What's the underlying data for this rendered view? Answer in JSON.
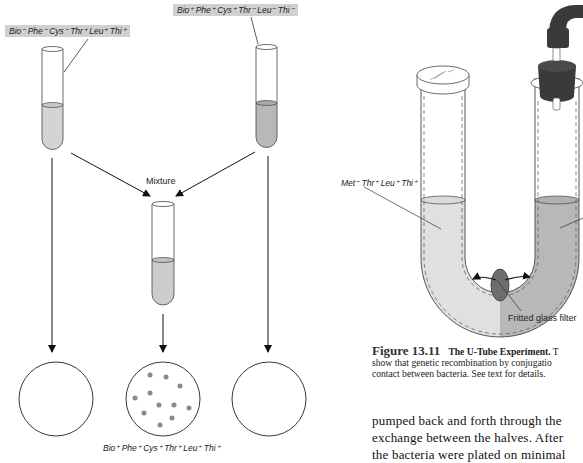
{
  "left_figure": {
    "strain_a_label": "Bio⁻ Phe⁻ Cys⁻ Thr⁺ Leu⁺ Thi⁺",
    "strain_b_label": "Bio⁺ Phe⁺ Cys⁺ Thr⁻ Leu⁻ Thi⁻",
    "mixture_label": "Mixture",
    "result_label": "Bio⁺ Phe⁺ Cys⁺ Thr⁺ Leu⁺ Thi⁺",
    "plates": [
      {
        "name": "strain-a-plate",
        "colonies": 0
      },
      {
        "name": "mixture-plate",
        "colonies": 12
      },
      {
        "name": "strain-b-plate",
        "colonies": 0
      }
    ]
  },
  "right_figure": {
    "left_arm_label": "Met⁻ Thr⁺ Leu⁺ Thi⁺",
    "filter_label": "Fritted glass filter",
    "caption": {
      "figure_number": "Figure 13.11",
      "title": "The U-Tube Experiment.",
      "line1_rest": " T",
      "line2": "show that genetic recombination by conjugatio",
      "line3": "contact between bacteria. See text for details."
    },
    "body_text": {
      "line1": "pumped back and forth through the",
      "line2": "exchange between the halves. After",
      "line3": "the bacteria were plated on minimal"
    }
  },
  "colors": {
    "liquid_light": "#d4d4d4",
    "liquid_dark": "#b4b4b4",
    "label_bg": "#d0d0d0",
    "colony": "#8a8a8a",
    "stopper": "#3a3a3a",
    "filter": "#6e6e6e"
  }
}
